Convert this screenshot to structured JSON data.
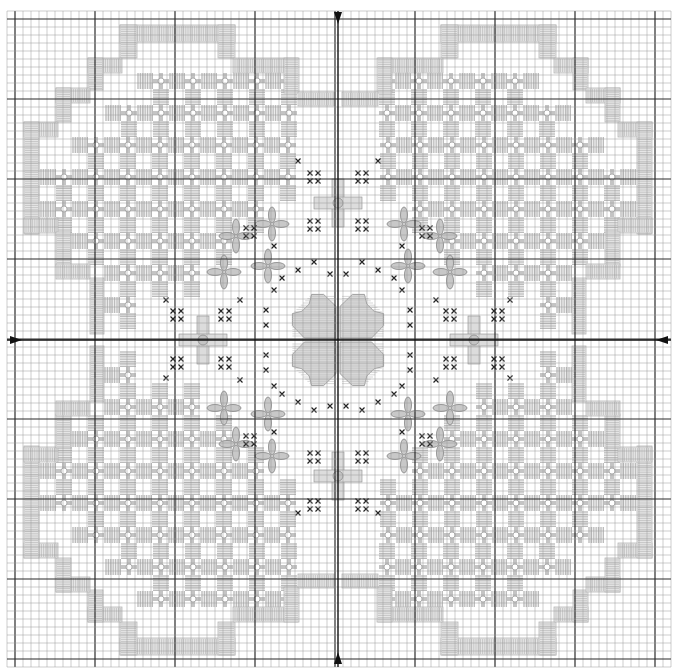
{
  "chart_data": {
    "type": "diagram",
    "title": "",
    "canvas": {
      "width": 674,
      "height": 671,
      "background": "#ffffff"
    },
    "grid": {
      "x0": 7,
      "y0": 11,
      "cell": 8,
      "cols": 83,
      "rows": 82,
      "minor_color": "#9a9a9a",
      "major_color": "#2a2a2a",
      "major_every": 10,
      "major_offset": 1
    },
    "center": {
      "x": 338,
      "y": 340
    },
    "center_arrows": [
      {
        "side": "top",
        "x": 338,
        "y": 12
      },
      {
        "side": "bottom",
        "x": 338,
        "y": 664
      },
      {
        "side": "left",
        "x": 10,
        "y": 340
      },
      {
        "side": "right",
        "x": 668,
        "y": 340
      }
    ],
    "colors": {
      "satin": "#b8b8b8",
      "kloster": "#b0b0b0",
      "woven_bar": "#c4c4c4",
      "cross": "#222222",
      "flower_fill": "#c8c8c8",
      "flower_stroke": "#8c8c8c"
    },
    "legend": [],
    "quadrant_border_bands_top_left": [
      {
        "x": 120,
        "y": 25,
        "w": 115,
        "h": 17,
        "dir": "h"
      },
      {
        "x": 120,
        "y": 25,
        "w": 17,
        "h": 33,
        "dir": "v"
      },
      {
        "x": 218,
        "y": 25,
        "w": 17,
        "h": 33,
        "dir": "v"
      },
      {
        "x": 233,
        "y": 58,
        "w": 65,
        "h": 15,
        "dir": "h"
      },
      {
        "x": 284,
        "y": 58,
        "w": 15,
        "h": 35,
        "dir": "v"
      },
      {
        "x": 298,
        "y": 92,
        "w": 36,
        "h": 14,
        "dir": "h"
      },
      {
        "x": 88,
        "y": 58,
        "w": 34,
        "h": 15,
        "dir": "h"
      },
      {
        "x": 88,
        "y": 58,
        "w": 15,
        "h": 32,
        "dir": "v"
      },
      {
        "x": 56,
        "y": 88,
        "w": 34,
        "h": 15,
        "dir": "h"
      },
      {
        "x": 56,
        "y": 88,
        "w": 15,
        "h": 34,
        "dir": "v"
      },
      {
        "x": 24,
        "y": 122,
        "w": 34,
        "h": 15,
        "dir": "h"
      },
      {
        "x": 24,
        "y": 122,
        "w": 15,
        "h": 112,
        "dir": "v"
      },
      {
        "x": 24,
        "y": 218,
        "w": 34,
        "h": 15,
        "dir": "h"
      },
      {
        "x": 56,
        "y": 232,
        "w": 15,
        "h": 34,
        "dir": "v"
      },
      {
        "x": 56,
        "y": 264,
        "w": 34,
        "h": 15,
        "dir": "h"
      },
      {
        "x": 90,
        "y": 278,
        "w": 14,
        "h": 56,
        "dir": "v"
      }
    ],
    "quadrant_fill_top_left": {
      "rows": [
        {
          "y": 73,
          "x_from": 137,
          "x_to": 282
        },
        {
          "y": 105,
          "x_from": 105,
          "x_to": 298
        },
        {
          "y": 137,
          "x_from": 72,
          "x_to": 300
        },
        {
          "y": 169,
          "x_from": 40,
          "x_to": 280
        },
        {
          "y": 201,
          "x_from": 40,
          "x_to": 250
        },
        {
          "y": 233,
          "x_from": 72,
          "x_to": 220
        },
        {
          "y": 265,
          "x_from": 104,
          "x_to": 190
        },
        {
          "y": 297,
          "x_from": 104,
          "x_to": 150
        }
      ],
      "unit": 32
    },
    "center_motif": {
      "type": "four-petal satin flower",
      "x": 338,
      "y": 340,
      "size": 96
    },
    "satin_stars": [
      {
        "x": 338,
        "y": 203
      },
      {
        "x": 338,
        "y": 476
      },
      {
        "x": 203,
        "y": 340
      },
      {
        "x": 474,
        "y": 340
      }
    ],
    "petal_flowers": [
      {
        "x": 236,
        "y": 236
      },
      {
        "x": 272,
        "y": 224
      },
      {
        "x": 224,
        "y": 272
      },
      {
        "x": 268,
        "y": 266
      },
      {
        "x": 404,
        "y": 224
      },
      {
        "x": 440,
        "y": 236
      },
      {
        "x": 408,
        "y": 266
      },
      {
        "x": 450,
        "y": 272
      },
      {
        "x": 224,
        "y": 408
      },
      {
        "x": 236,
        "y": 444
      },
      {
        "x": 268,
        "y": 414
      },
      {
        "x": 272,
        "y": 456
      },
      {
        "x": 408,
        "y": 414
      },
      {
        "x": 450,
        "y": 408
      },
      {
        "x": 404,
        "y": 456
      },
      {
        "x": 440,
        "y": 444
      }
    ],
    "cross_groups": [
      {
        "cx": 314,
        "cy": 177
      },
      {
        "cx": 362,
        "cy": 177
      },
      {
        "cx": 314,
        "cy": 225
      },
      {
        "cx": 362,
        "cy": 225
      },
      {
        "cx": 314,
        "cy": 457
      },
      {
        "cx": 362,
        "cy": 457
      },
      {
        "cx": 314,
        "cy": 505
      },
      {
        "cx": 362,
        "cy": 505
      },
      {
        "cx": 177,
        "cy": 315
      },
      {
        "cx": 225,
        "cy": 315
      },
      {
        "cx": 177,
        "cy": 363
      },
      {
        "cx": 225,
        "cy": 363
      },
      {
        "cx": 450,
        "cy": 315
      },
      {
        "cx": 498,
        "cy": 315
      },
      {
        "cx": 450,
        "cy": 363
      },
      {
        "cx": 498,
        "cy": 363
      },
      {
        "cx": 250,
        "cy": 232
      },
      {
        "cx": 426,
        "cy": 232
      },
      {
        "cx": 250,
        "cy": 440
      },
      {
        "cx": 426,
        "cy": 440
      }
    ],
    "single_crosses": [
      {
        "x": 298,
        "y": 161
      },
      {
        "x": 378,
        "y": 161
      },
      {
        "x": 298,
        "y": 513
      },
      {
        "x": 378,
        "y": 513
      },
      {
        "x": 166,
        "y": 300
      },
      {
        "x": 166,
        "y": 378
      },
      {
        "x": 510,
        "y": 300
      },
      {
        "x": 510,
        "y": 378
      },
      {
        "x": 314,
        "y": 262
      },
      {
        "x": 362,
        "y": 262
      },
      {
        "x": 314,
        "y": 410
      },
      {
        "x": 362,
        "y": 410
      },
      {
        "x": 298,
        "y": 270
      },
      {
        "x": 378,
        "y": 270
      },
      {
        "x": 298,
        "y": 402
      },
      {
        "x": 378,
        "y": 402
      },
      {
        "x": 282,
        "y": 278
      },
      {
        "x": 394,
        "y": 278
      },
      {
        "x": 282,
        "y": 394
      },
      {
        "x": 394,
        "y": 394
      },
      {
        "x": 274,
        "y": 290
      },
      {
        "x": 402,
        "y": 290
      },
      {
        "x": 274,
        "y": 386
      },
      {
        "x": 402,
        "y": 386
      },
      {
        "x": 266,
        "y": 310
      },
      {
        "x": 410,
        "y": 310
      },
      {
        "x": 266,
        "y": 370
      },
      {
        "x": 410,
        "y": 370
      },
      {
        "x": 266,
        "y": 325
      },
      {
        "x": 410,
        "y": 325
      },
      {
        "x": 266,
        "y": 355
      },
      {
        "x": 410,
        "y": 355
      },
      {
        "x": 274,
        "y": 246
      },
      {
        "x": 402,
        "y": 246
      },
      {
        "x": 274,
        "y": 432
      },
      {
        "x": 402,
        "y": 432
      },
      {
        "x": 240,
        "y": 300
      },
      {
        "x": 436,
        "y": 300
      },
      {
        "x": 240,
        "y": 380
      },
      {
        "x": 436,
        "y": 380
      },
      {
        "x": 330,
        "y": 406
      },
      {
        "x": 346,
        "y": 406
      },
      {
        "x": 330,
        "y": 274
      },
      {
        "x": 346,
        "y": 274
      }
    ]
  }
}
